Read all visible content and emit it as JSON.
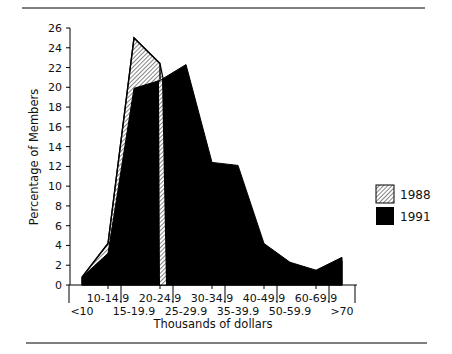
{
  "chart_data": {
    "type": "area",
    "title": "",
    "xlabel": "Thousands of dollars",
    "ylabel": "Percentage of Members",
    "ylim": [
      0,
      26
    ],
    "yticks": [
      0,
      2,
      4,
      6,
      8,
      10,
      12,
      14,
      16,
      18,
      20,
      22,
      24,
      26
    ],
    "grid": false,
    "legend_position": "right",
    "categories": [
      "<10",
      "10-14.9",
      "15-19.9",
      "20-24.9",
      "25-29.9",
      "30-34.9",
      "35-39.9",
      "40-49.9",
      "50-59.9",
      "60-69.9",
      ">70"
    ],
    "series": [
      {
        "name": "1988",
        "style": "hatched",
        "values": [
          0.8,
          4.2,
          25.0,
          22.4,
          9.7,
          9.7,
          8.2,
          3.3,
          1.8,
          1.3,
          2.4
        ]
      },
      {
        "name": "1991",
        "style": "solid black",
        "values": [
          0.8,
          3.2,
          19.9,
          20.7,
          22.3,
          12.4,
          12.1,
          4.2,
          2.3,
          1.5,
          2.8
        ]
      }
    ]
  },
  "legend": {
    "items": [
      {
        "label": "1988",
        "fill": "hatched"
      },
      {
        "label": "1991",
        "fill": "#000000"
      }
    ]
  },
  "colors": {
    "ink": "#000000",
    "background": "#ffffff",
    "hatch": "#555555"
  }
}
